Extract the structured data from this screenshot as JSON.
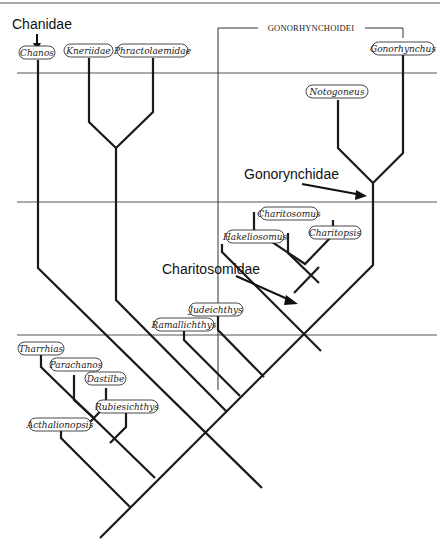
{
  "diagram": {
    "type": "cladogram",
    "bracket_label": "GONORHYNCHOIDEI",
    "group_labels": {
      "chanidae": "Chanidae",
      "gonorynchidae": "Gonorynchidae",
      "charitosomidae": "Charitosomidae"
    },
    "taxa": [
      {
        "id": "chanos",
        "label": "Chanos"
      },
      {
        "id": "kneriidae",
        "label": "Kneriidae"
      },
      {
        "id": "phractolaemidae",
        "label": "Phractolaemidae"
      },
      {
        "id": "gonorhynchus",
        "label": "Gonorhynchus"
      },
      {
        "id": "notogoneus",
        "label": "Notogoneus"
      },
      {
        "id": "charitosomus",
        "label": "Charitosomus"
      },
      {
        "id": "hakeliosomus",
        "label": "Hakeliosomus"
      },
      {
        "id": "charitopsis",
        "label": "Charitopsis"
      },
      {
        "id": "judeichthys",
        "label": "Judeichthys"
      },
      {
        "id": "ramallichthys",
        "label": "Ramallichthys"
      },
      {
        "id": "tharrhias",
        "label": "Tharrhias"
      },
      {
        "id": "parachanos",
        "label": "Parachanos"
      },
      {
        "id": "dastilbe",
        "label": "Dastilbe"
      },
      {
        "id": "rubiesichthys",
        "label": "Rubiesichthys"
      },
      {
        "id": "acthalionopsis",
        "label": "Acthalionopsis"
      }
    ]
  }
}
